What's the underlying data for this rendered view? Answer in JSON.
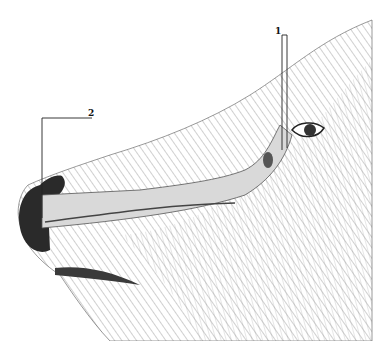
{
  "figure": {
    "labels": [
      {
        "id": "1",
        "text": "1",
        "target": "lacrimal sac near medial eye corner"
      },
      {
        "id": "2",
        "text": "2",
        "target": "nasal opening of duct at nostril"
      }
    ],
    "colors": {
      "background": "#ffffff",
      "ink": "#222222",
      "duct_fill": "#d9d9d9",
      "fur": "#9a9a9a"
    }
  }
}
